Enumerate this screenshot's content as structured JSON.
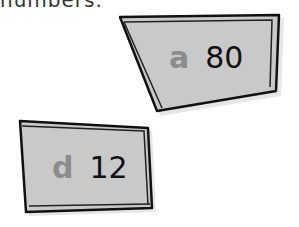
{
  "header": {
    "partial_text": "numbers."
  },
  "cards": [
    {
      "letter": "a",
      "number": "80"
    },
    {
      "letter": "d",
      "number": "12"
    }
  ],
  "colors": {
    "card_fill": "#c8c8c8",
    "card_border": "#111111",
    "letter": "#8c8c8c",
    "number": "#111111"
  }
}
